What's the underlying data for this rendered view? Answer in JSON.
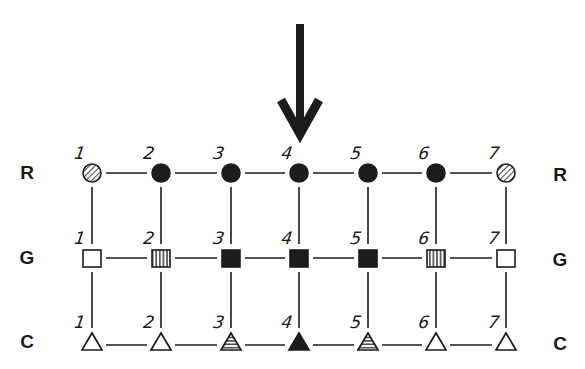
{
  "diagram": {
    "arrow": {
      "label": "down-arrow",
      "column": 4,
      "color": "#1c1c1c"
    },
    "columns": [
      "1",
      "2",
      "3",
      "4",
      "5",
      "6",
      "7"
    ],
    "rows": [
      {
        "key": "R",
        "label_left": "R",
        "label_right": "R",
        "shape": "circle",
        "nodes": [
          {
            "number": "1",
            "fill": "hatched-diagonal"
          },
          {
            "number": "2",
            "fill": "solid"
          },
          {
            "number": "3",
            "fill": "solid"
          },
          {
            "number": "4",
            "fill": "solid"
          },
          {
            "number": "5",
            "fill": "solid"
          },
          {
            "number": "6",
            "fill": "solid"
          },
          {
            "number": "7",
            "fill": "hatched-diagonal"
          }
        ]
      },
      {
        "key": "G",
        "label_left": "G",
        "label_right": "G",
        "shape": "square",
        "nodes": [
          {
            "number": "1",
            "fill": "empty"
          },
          {
            "number": "2",
            "fill": "hatched-vertical"
          },
          {
            "number": "3",
            "fill": "solid"
          },
          {
            "number": "4",
            "fill": "solid"
          },
          {
            "number": "5",
            "fill": "solid"
          },
          {
            "number": "6",
            "fill": "hatched-vertical"
          },
          {
            "number": "7",
            "fill": "empty"
          }
        ]
      },
      {
        "key": "C",
        "label_left": "C",
        "label_right": "C",
        "shape": "triangle",
        "nodes": [
          {
            "number": "1",
            "fill": "empty"
          },
          {
            "number": "2",
            "fill": "empty"
          },
          {
            "number": "3",
            "fill": "hatched-horizontal"
          },
          {
            "number": "4",
            "fill": "solid"
          },
          {
            "number": "5",
            "fill": "hatched-horizontal"
          },
          {
            "number": "6",
            "fill": "empty"
          },
          {
            "number": "7",
            "fill": "empty"
          }
        ]
      }
    ],
    "colors": {
      "ink": "#1c1c1c",
      "background": "#ffffff"
    }
  }
}
